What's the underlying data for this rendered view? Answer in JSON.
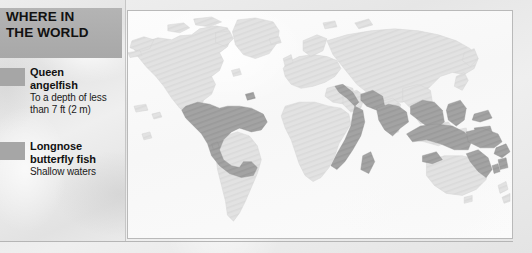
{
  "panel": {
    "title": "WHERE IN\nTHE WORLD",
    "legend": [
      {
        "swatch_color": "#a6a6a6",
        "name": "Queen\nangelfish",
        "description": "To a depth of less\nthan 7 ft (2 m)"
      },
      {
        "swatch_color": "#a6a6a6",
        "name": "Longnose\nbutterfly fish",
        "description": "Shallow waters"
      }
    ]
  },
  "map": {
    "type": "world-distribution-map",
    "projection": "equirectangular",
    "land_color": "#e0e0e0",
    "land_stroke": "#d0d0d0",
    "ocean_color": "#fbfbfb",
    "highlight_color": "#9d9d9d",
    "highlighted_regions": [
      "Gulf of Mexico",
      "Caribbean Sea",
      "Central America",
      "Northern South America coast",
      "Red Sea",
      "East Africa coast",
      "Arabian Sea",
      "India coast",
      "Bay of Bengal",
      "Southeast Asia",
      "Indonesia",
      "Philippines",
      "Micronesia",
      "Melanesia",
      "Great Barrier Reef"
    ]
  }
}
